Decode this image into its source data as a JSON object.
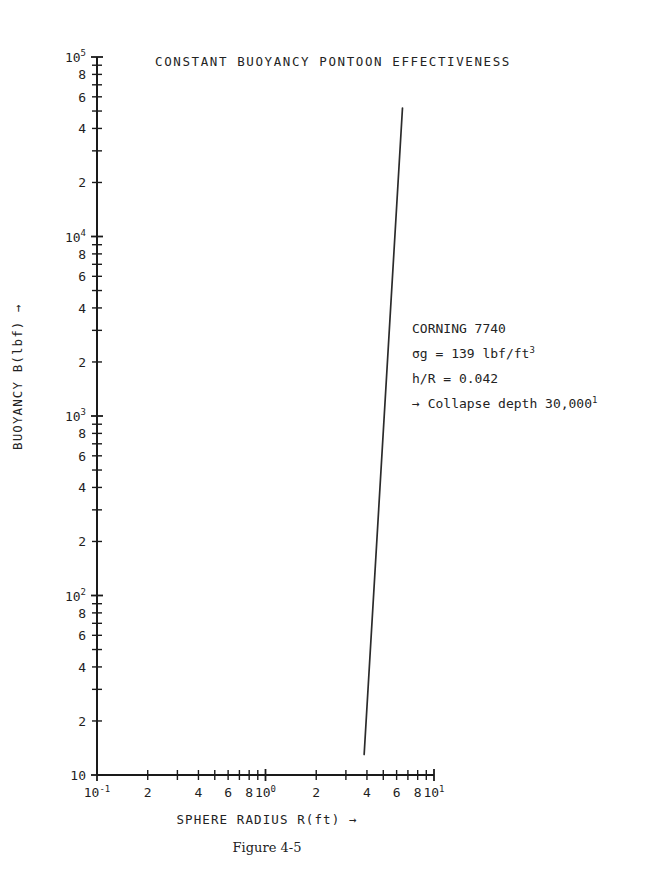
{
  "chart_data": {
    "type": "line",
    "title": "CONSTANT BUOYANCY PONTOON EFFECTIVENESS",
    "xlabel": "SPHERE RADIUS R(ft) →",
    "ylabel": "BUOYANCY B(lbf) →",
    "xscale": "log",
    "yscale": "log",
    "xlim": [
      0.1,
      10
    ],
    "ylim": [
      10,
      100000
    ],
    "grid": false,
    "legend": null,
    "caption": "Figure 4-5",
    "series": [
      {
        "name": "Corning 7740 pontoon buoyancy",
        "x": [
          3.85,
          6.5
        ],
        "y": [
          13,
          52000
        ],
        "comment_slope": "power law, B proportional to R^3"
      }
    ],
    "x_ticks": [
      {
        "value": 0.1,
        "label": "10",
        "exp": "-1",
        "major": true
      },
      {
        "value": 0.2,
        "label": "2",
        "exp": "",
        "major": false
      },
      {
        "value": 0.3,
        "label": "",
        "exp": "",
        "major": false
      },
      {
        "value": 0.4,
        "label": "4",
        "exp": "",
        "major": false
      },
      {
        "value": 0.5,
        "label": "",
        "exp": "",
        "major": false
      },
      {
        "value": 0.6,
        "label": "6",
        "exp": "",
        "major": false
      },
      {
        "value": 0.7,
        "label": "",
        "exp": "",
        "major": false
      },
      {
        "value": 0.8,
        "label": "8",
        "exp": "",
        "major": false
      },
      {
        "value": 0.9,
        "label": "",
        "exp": "",
        "major": false
      },
      {
        "value": 1.0,
        "label": "10",
        "exp": "0",
        "major": true
      },
      {
        "value": 2.0,
        "label": "2",
        "exp": "",
        "major": false
      },
      {
        "value": 3.0,
        "label": "",
        "exp": "",
        "major": false
      },
      {
        "value": 4.0,
        "label": "4",
        "exp": "",
        "major": false
      },
      {
        "value": 5.0,
        "label": "",
        "exp": "",
        "major": false
      },
      {
        "value": 6.0,
        "label": "6",
        "exp": "",
        "major": false
      },
      {
        "value": 7.0,
        "label": "",
        "exp": "",
        "major": false
      },
      {
        "value": 8.0,
        "label": "8",
        "exp": "",
        "major": false
      },
      {
        "value": 9.0,
        "label": "",
        "exp": "",
        "major": false
      },
      {
        "value": 10.0,
        "label": "10",
        "exp": "1",
        "major": true
      }
    ],
    "y_ticks": [
      {
        "value": 10,
        "label": "10",
        "exp": "",
        "major": true
      },
      {
        "value": 20,
        "label": "2",
        "exp": "",
        "major": false
      },
      {
        "value": 30,
        "label": "",
        "exp": "",
        "major": false
      },
      {
        "value": 40,
        "label": "4",
        "exp": "",
        "major": false
      },
      {
        "value": 50,
        "label": "",
        "exp": "",
        "major": false
      },
      {
        "value": 60,
        "label": "6",
        "exp": "",
        "major": false
      },
      {
        "value": 70,
        "label": "",
        "exp": "",
        "major": false
      },
      {
        "value": 80,
        "label": "8",
        "exp": "",
        "major": false
      },
      {
        "value": 90,
        "label": "",
        "exp": "",
        "major": false
      },
      {
        "value": 100,
        "label": "10",
        "exp": "2",
        "major": true
      },
      {
        "value": 200,
        "label": "2",
        "exp": "",
        "major": false
      },
      {
        "value": 300,
        "label": "",
        "exp": "",
        "major": false
      },
      {
        "value": 400,
        "label": "4",
        "exp": "",
        "major": false
      },
      {
        "value": 500,
        "label": "",
        "exp": "",
        "major": false
      },
      {
        "value": 600,
        "label": "6",
        "exp": "",
        "major": false
      },
      {
        "value": 700,
        "label": "",
        "exp": "",
        "major": false
      },
      {
        "value": 800,
        "label": "8",
        "exp": "",
        "major": false
      },
      {
        "value": 900,
        "label": "",
        "exp": "",
        "major": false
      },
      {
        "value": 1000,
        "label": "10",
        "exp": "3",
        "major": true
      },
      {
        "value": 2000,
        "label": "2",
        "exp": "",
        "major": false
      },
      {
        "value": 3000,
        "label": "",
        "exp": "",
        "major": false
      },
      {
        "value": 4000,
        "label": "4",
        "exp": "",
        "major": false
      },
      {
        "value": 5000,
        "label": "",
        "exp": "",
        "major": false
      },
      {
        "value": 6000,
        "label": "6",
        "exp": "",
        "major": false
      },
      {
        "value": 7000,
        "label": "",
        "exp": "",
        "major": false
      },
      {
        "value": 8000,
        "label": "8",
        "exp": "",
        "major": false
      },
      {
        "value": 9000,
        "label": "",
        "exp": "",
        "major": false
      },
      {
        "value": 10000,
        "label": "10",
        "exp": "4",
        "major": true
      },
      {
        "value": 20000,
        "label": "2",
        "exp": "",
        "major": false
      },
      {
        "value": 30000,
        "label": "",
        "exp": "",
        "major": false
      },
      {
        "value": 40000,
        "label": "4",
        "exp": "",
        "major": false
      },
      {
        "value": 50000,
        "label": "",
        "exp": "",
        "major": false
      },
      {
        "value": 60000,
        "label": "6",
        "exp": "",
        "major": false
      },
      {
        "value": 70000,
        "label": "",
        "exp": "",
        "major": false
      },
      {
        "value": 80000,
        "label": "8",
        "exp": "",
        "major": false
      },
      {
        "value": 90000,
        "label": "",
        "exp": "",
        "major": false
      },
      {
        "value": 100000,
        "label": "10",
        "exp": "5",
        "major": true
      }
    ],
    "annotations": [
      {
        "text": "CORNING 7740",
        "sup": ""
      },
      {
        "text": "σg = 139 lbf/ft",
        "sup": "3"
      },
      {
        "text": "h/R = 0.042",
        "sup": ""
      },
      {
        "text": "→ Collapse depth 30,000",
        "sup": "1"
      }
    ]
  },
  "colors": {
    "line": "#2b2b2b",
    "axis": "#1a1a1a",
    "text": "#232323",
    "background": "#ffffff"
  }
}
